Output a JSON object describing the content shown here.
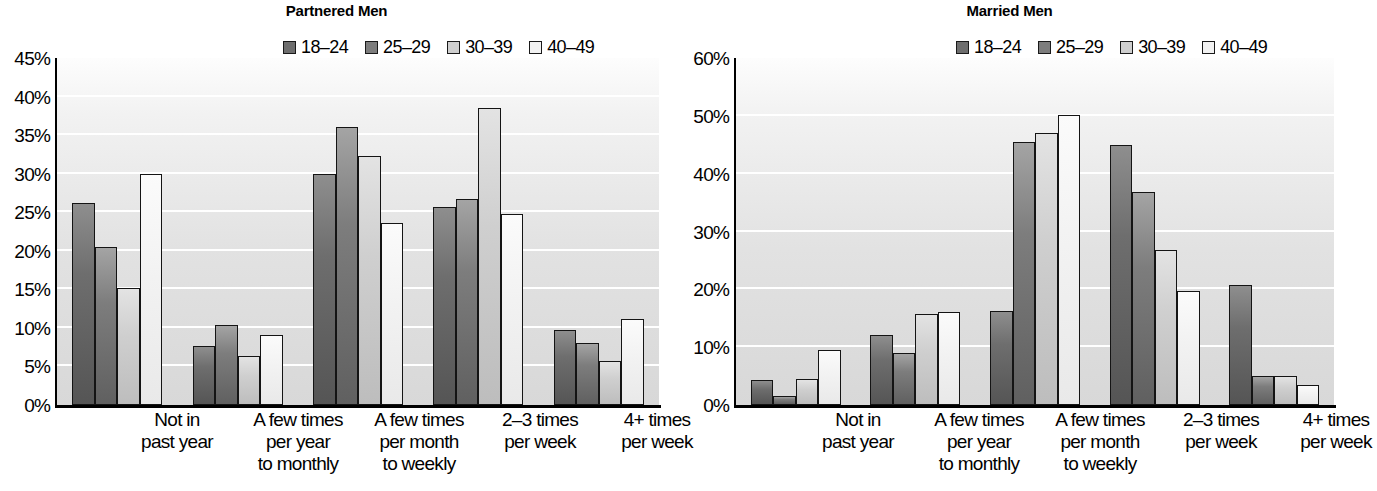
{
  "chart_data": [
    {
      "type": "bar",
      "title": "Partnered Men",
      "xlabel": "",
      "ylabel": "",
      "ylim": [
        0,
        45
      ],
      "ytick_step": 5,
      "ytick_labels": [
        "45%",
        "40%",
        "35%",
        "30%",
        "25%",
        "20%",
        "15%",
        "10%",
        "5%",
        "0%"
      ],
      "grid": true,
      "legend_position": "top-right",
      "categories": [
        "Not in\npast year",
        "A few times\nper year\nto monthly",
        "A few times\nper month\nto weekly",
        "2–3 times\nper week",
        "4+ times\nper week"
      ],
      "series": [
        {
          "name": "18–24",
          "color": "#6e6e6e",
          "values": [
            26.2,
            7.6,
            30.0,
            25.7,
            9.7
          ]
        },
        {
          "name": "25–29",
          "color": "#7d7d7d",
          "values": [
            20.5,
            10.4,
            36.0,
            26.7,
            8.0
          ]
        },
        {
          "name": "30–39",
          "color": "#cfcfcf",
          "values": [
            15.2,
            6.3,
            32.3,
            38.5,
            5.7
          ]
        },
        {
          "name": "40–49",
          "color": "#f2f2f2",
          "values": [
            30.0,
            9.1,
            23.6,
            24.8,
            11.1
          ]
        }
      ]
    },
    {
      "type": "bar",
      "title": "Married Men",
      "xlabel": "",
      "ylabel": "",
      "ylim": [
        0,
        60
      ],
      "ytick_step": 10,
      "ytick_labels": [
        "60%",
        "50%",
        "40%",
        "30%",
        "20%",
        "10%",
        "0%"
      ],
      "grid": true,
      "legend_position": "top-right",
      "categories": [
        "Not in\npast year",
        "A few times\nper year\nto monthly",
        "A few times\nper month\nto weekly",
        "2–3 times\nper week",
        "4+ times\nper week"
      ],
      "series": [
        {
          "name": "18–24",
          "color": "#6e6e6e",
          "values": [
            4.4,
            12.1,
            16.3,
            45.0,
            20.7
          ]
        },
        {
          "name": "25–29",
          "color": "#7d7d7d",
          "values": [
            1.5,
            9.0,
            45.5,
            36.8,
            5.0
          ]
        },
        {
          "name": "30–39",
          "color": "#cfcfcf",
          "values": [
            4.5,
            15.8,
            47.0,
            26.8,
            5.1
          ]
        },
        {
          "name": "40–49",
          "color": "#f2f2f2",
          "values": [
            9.5,
            16.0,
            50.2,
            19.8,
            3.4
          ]
        }
      ]
    }
  ],
  "panels": [
    {
      "title": "Partnered Men",
      "legend": [
        "18–24",
        "25–29",
        "30–39",
        "40–49"
      ],
      "ytick_labels": [
        "45%",
        "40%",
        "35%",
        "30%",
        "25%",
        "20%",
        "15%",
        "10%",
        "5%",
        "0%"
      ],
      "categories": [
        [
          "Not in",
          "past year"
        ],
        [
          "A few times",
          "per year",
          "to monthly"
        ],
        [
          "A few times",
          "per month",
          "to weekly"
        ],
        [
          "2–3 times",
          "per week"
        ],
        [
          "4+ times",
          "per week"
        ]
      ]
    },
    {
      "title": "Married Men",
      "legend": [
        "18–24",
        "25–29",
        "30–39",
        "40–49"
      ],
      "ytick_labels": [
        "60%",
        "50%",
        "40%",
        "30%",
        "20%",
        "10%",
        "0%"
      ],
      "categories": [
        [
          "Not in",
          "past year"
        ],
        [
          "A few times",
          "per year",
          "to monthly"
        ],
        [
          "A few times",
          "per month",
          "to weekly"
        ],
        [
          "2–3 times",
          "per week"
        ],
        [
          "4+ times",
          "per week"
        ]
      ]
    }
  ]
}
